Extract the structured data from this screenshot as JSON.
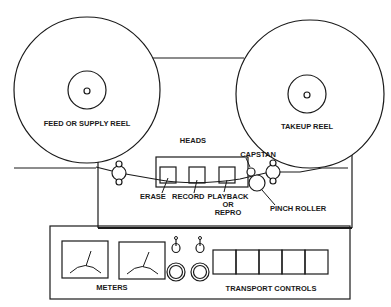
{
  "diagram": {
    "reels": {
      "supply": {
        "label": "FEED OR SUPPLY REEL"
      },
      "takeup": {
        "label": "TAKEUP REEL"
      }
    },
    "heads": {
      "group_label": "HEADS",
      "erase": "ERASE",
      "record": "RECORD",
      "playback_line1": "PLAYBACK",
      "playback_line2": "OR",
      "playback_line3": "REPRO"
    },
    "capstan": "CAPSTAN",
    "pinch_roller": "PINCH ROLLER",
    "panel": {
      "meters": "METERS",
      "transport_controls": "TRANSPORT CONTROLS",
      "transport_button_count": 5
    }
  }
}
